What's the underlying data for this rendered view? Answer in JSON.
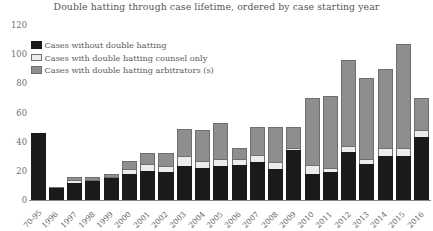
{
  "chart_data": {
    "type": "bar",
    "title": "Double hatting through case lifetime, ordered by case starting year",
    "xlabel": "",
    "ylabel": "",
    "ylim": [
      0,
      120
    ],
    "yticks": [
      0,
      20,
      40,
      60,
      80,
      100,
      120
    ],
    "grid": false,
    "legend_position": "top-left",
    "stacked": true,
    "categories": [
      "70-95",
      "1996",
      "1997",
      "1998",
      "1999",
      "2000",
      "2001",
      "2002",
      "2003",
      "2004",
      "2005",
      "2006",
      "2007",
      "2008",
      "2009",
      "2010",
      "2011",
      "2012",
      "2013",
      "2014",
      "2015",
      "2016"
    ],
    "series": [
      {
        "name": "Cases without double hatting",
        "color": "#1a1a1a",
        "values": [
          46,
          8,
          12,
          13,
          15,
          18,
          20,
          19,
          23,
          22,
          23,
          24,
          26,
          21,
          34,
          18,
          19,
          33,
          25,
          30,
          30,
          43
        ]
      },
      {
        "name": "Cases with double hatting counsel only",
        "color": "#ececec",
        "values": [
          0,
          0,
          2,
          1,
          1,
          3,
          5,
          4,
          7,
          5,
          5,
          4,
          5,
          5,
          2,
          6,
          3,
          4,
          3,
          6,
          6,
          5
        ]
      },
      {
        "name": "Cases with double hatting arbitrators (s)",
        "color": "#8e8e8e",
        "values": [
          0,
          1,
          2,
          2,
          2,
          6,
          7,
          9,
          19,
          21,
          25,
          8,
          19,
          24,
          14,
          46,
          49,
          59,
          56,
          54,
          71,
          22
        ]
      }
    ],
    "totals": [
      46,
      9,
      16,
      16,
      18,
      27,
      32,
      32,
      49,
      48,
      53,
      36,
      50,
      50,
      50,
      70,
      71,
      96,
      84,
      90,
      107,
      70
    ]
  },
  "legend": {
    "items": [
      {
        "label": "Cases without double hatting",
        "swatch": "none"
      },
      {
        "label": "Cases with double hatting counsel only",
        "swatch": "counsel"
      },
      {
        "label": "Cases with double hatting arbitrators (s)",
        "swatch": "arb"
      }
    ]
  }
}
